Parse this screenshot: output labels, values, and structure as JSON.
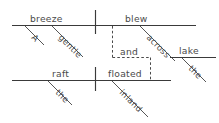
{
  "diagram": {
    "type": "sentence-diagram",
    "style": "Reed-Kellogg",
    "sentence": "A gentle breeze blew across the lake and the raft floated inland.",
    "colors": {
      "line": "#3a3a3a",
      "text": "#4a4a4a",
      "background": "#ffffff",
      "dashed": "#4a4a4a"
    },
    "clauses": [
      {
        "id": "clause-1",
        "subject": "breeze",
        "verb": "blew",
        "modifiers": [
          "A",
          "gentle"
        ],
        "prepositional_phrase": {
          "preposition": "across",
          "object": "lake",
          "article": "the"
        }
      },
      {
        "id": "clause-2",
        "subject": "raft",
        "verb": "floated",
        "modifiers": [
          "the"
        ],
        "adverb": "inland"
      }
    ],
    "conjunction": "and",
    "words": {
      "article_a": "A",
      "adjective_gentle": "gentle",
      "subject_breeze": "breeze",
      "verb_blew": "blew",
      "preposition_across": "across",
      "article_the_lake": "the",
      "object_lake": "lake",
      "conjunction_and": "and",
      "article_the_raft": "the",
      "subject_raft": "raft",
      "verb_floated": "floated",
      "adverb_inland": "inland"
    }
  }
}
